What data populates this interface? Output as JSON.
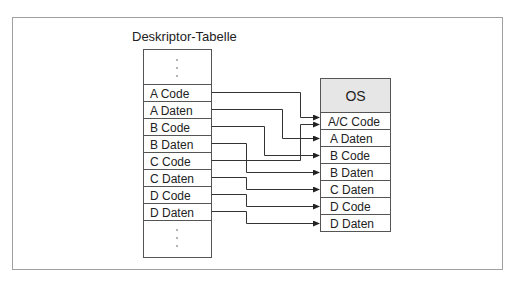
{
  "diagram": {
    "title": "Deskriptor-Tabelle",
    "colors": {
      "frame": "#a0a0a0",
      "line": "#333333",
      "os_header_fill": "#e6e6e6",
      "border": "#555555"
    },
    "left_table": {
      "ellipsis_top": "⋮",
      "rows": [
        {
          "label": "A Code"
        },
        {
          "label": "A Daten"
        },
        {
          "label": "B Code"
        },
        {
          "label": "B Daten"
        },
        {
          "label": "C Code"
        },
        {
          "label": "C Daten"
        },
        {
          "label": "D Code"
        },
        {
          "label": "D Daten"
        }
      ],
      "ellipsis_bottom": "⋮"
    },
    "right_table": {
      "header": "OS",
      "rows": [
        {
          "label": "A/C Code"
        },
        {
          "label": "A Daten"
        },
        {
          "label": "B Code"
        },
        {
          "label": "B Daten"
        },
        {
          "label": "C Daten"
        },
        {
          "label": "D Code"
        },
        {
          "label": "D Daten"
        }
      ]
    },
    "connections": [
      {
        "from": "A Code",
        "to": "A/C Code"
      },
      {
        "from": "C Code",
        "to": "A/C Code"
      },
      {
        "from": "A Daten",
        "to": "A Daten"
      },
      {
        "from": "B Code",
        "to": "B Code"
      },
      {
        "from": "B Daten",
        "to": "B Daten"
      },
      {
        "from": "C Daten",
        "to": "C Daten"
      },
      {
        "from": "D Code",
        "to": "D Code"
      },
      {
        "from": "D Daten",
        "to": "D Daten"
      }
    ]
  }
}
